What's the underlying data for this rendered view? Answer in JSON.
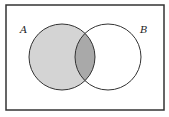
{
  "diagram": {
    "type": "venn",
    "sets": [
      {
        "label": "A",
        "shaded": true
      },
      {
        "label": "B",
        "shaded": false
      }
    ],
    "highlight": "A (including intersection A∩B)",
    "colors": {
      "a_fill": "#d4d4d4",
      "intersection_fill": "#a9a9a9",
      "stroke": "#333333",
      "frame": "#333333"
    }
  }
}
